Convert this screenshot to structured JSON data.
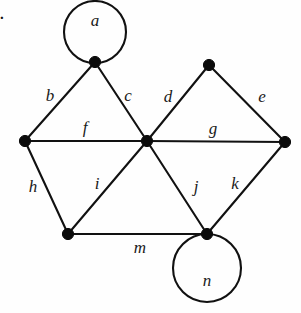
{
  "figure": {
    "item_marker": ".",
    "width": 301,
    "height": 313,
    "background_color": "#fefefe",
    "ink_color": "#111111"
  },
  "graph": {
    "vertices": [
      {
        "id": "v1",
        "name": "top-vertex",
        "x": 95,
        "y": 62
      },
      {
        "id": "v2",
        "name": "left-vertex",
        "x": 25,
        "y": 141
      },
      {
        "id": "v3",
        "name": "center-vertex",
        "x": 147,
        "y": 141
      },
      {
        "id": "v4",
        "name": "top-right-vertex",
        "x": 209,
        "y": 65
      },
      {
        "id": "v5",
        "name": "right-vertex",
        "x": 285,
        "y": 142
      },
      {
        "id": "v6",
        "name": "bottom-left-vertex",
        "x": 68,
        "y": 234
      },
      {
        "id": "v7",
        "name": "bottom-right-vertex",
        "x": 207,
        "y": 234
      }
    ],
    "edges": [
      {
        "label": "b",
        "from": "v2",
        "to": "v1",
        "label_x": 50,
        "label_y": 95
      },
      {
        "label": "c",
        "from": "v1",
        "to": "v3",
        "label_x": 128,
        "label_y": 95
      },
      {
        "label": "d",
        "from": "v3",
        "to": "v4",
        "label_x": 168,
        "label_y": 96
      },
      {
        "label": "e",
        "from": "v4",
        "to": "v5",
        "label_x": 262,
        "label_y": 96
      },
      {
        "label": "f",
        "from": "v2",
        "to": "v3",
        "label_x": 85,
        "label_y": 127
      },
      {
        "label": "g",
        "from": "v3",
        "to": "v5",
        "label_x": 213,
        "label_y": 128
      },
      {
        "label": "h",
        "from": "v2",
        "to": "v6",
        "label_x": 33,
        "label_y": 186
      },
      {
        "label": "i",
        "from": "v6",
        "to": "v3",
        "label_x": 97,
        "label_y": 183
      },
      {
        "label": "j",
        "from": "v3",
        "to": "v7",
        "label_x": 196,
        "label_y": 186
      },
      {
        "label": "k",
        "from": "v7",
        "to": "v5",
        "label_x": 235,
        "label_y": 183
      },
      {
        "label": "m",
        "from": "v6",
        "to": "v7",
        "label_x": 140,
        "label_y": 247
      }
    ],
    "loops": [
      {
        "label": "a",
        "at": "v1",
        "cx": 95,
        "cy": 32,
        "r": 31,
        "label_x": 95,
        "label_y": 20
      },
      {
        "label": "n",
        "at": "v7",
        "cx": 207,
        "cy": 268,
        "r": 34,
        "label_x": 207,
        "label_y": 280
      }
    ]
  }
}
